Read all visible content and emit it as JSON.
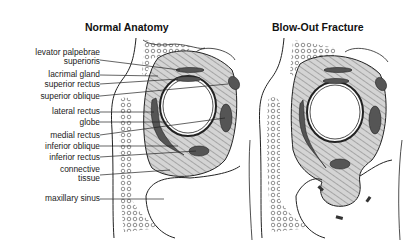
{
  "panels": [
    {
      "title": "Normal Anatomy"
    },
    {
      "title": "Blow-Out Fracture"
    }
  ],
  "labels": [
    {
      "text": "levator palpebrae",
      "text2": "superioris"
    },
    {
      "text": "lacrimal gland"
    },
    {
      "text": "superior rectus"
    },
    {
      "text": "superior oblique"
    },
    {
      "text": "lateral rectus"
    },
    {
      "text": "globe"
    },
    {
      "text": "medial rectus"
    },
    {
      "text": "inferior oblique"
    },
    {
      "text": "inferior rectus"
    },
    {
      "text": "connective",
      "text2": "tissue"
    },
    {
      "text": "maxillary sinus"
    }
  ],
  "colors": {
    "line": "#222222",
    "tissue": "#cfcfcf",
    "muscle": "#555555",
    "background": "#ffffff"
  }
}
